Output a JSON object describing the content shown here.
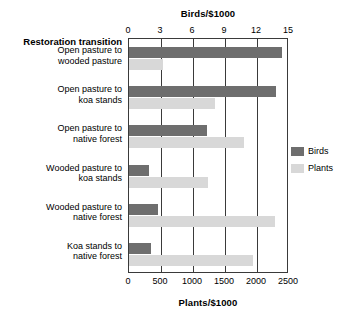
{
  "chart_data": {
    "type": "bar",
    "orientation": "horizontal",
    "title": "",
    "categories": [
      "Open pasture to wooded pasture",
      "Open pasture to koa stands",
      "Open pasture to native forest",
      "Wooded pasture to koa stands",
      "Wooded pasture to native forest",
      "Koa stands to native forest"
    ],
    "category_lines": [
      [
        "Open pasture to",
        "wooded pasture"
      ],
      [
        "Open pasture to",
        "koa stands"
      ],
      [
        "Open pasture to",
        "native forest"
      ],
      [
        "Wooded pasture to",
        "koa stands"
      ],
      [
        "Wooded pasture to",
        "native forest"
      ],
      [
        "Koa stands to",
        "native forest"
      ]
    ],
    "category_axis_label": "Restoration transition",
    "series": [
      {
        "name": "Birds",
        "axis": "top",
        "color": "#6e6e6e",
        "values": [
          14.3,
          13.8,
          7.3,
          1.9,
          2.7,
          2.1
        ]
      },
      {
        "name": "Plants",
        "axis": "bottom",
        "color": "#d8d8d8",
        "values": [
          530,
          1350,
          1800,
          1230,
          2280,
          1930
        ]
      }
    ],
    "top_axis": {
      "label": "Birds/$1000",
      "ticks": [
        0,
        3,
        6,
        9,
        12,
        15
      ],
      "min": 0,
      "max": 15
    },
    "bottom_axis": {
      "label": "Plants/$1000",
      "ticks": [
        0,
        500,
        1000,
        1500,
        2000,
        2500
      ],
      "min": 0,
      "max": 2500
    },
    "grid": true,
    "legend_position": "right",
    "legend": [
      {
        "label": "Birds",
        "color": "#6e6e6e"
      },
      {
        "label": "Plants",
        "color": "#d8d8d8"
      }
    ]
  }
}
